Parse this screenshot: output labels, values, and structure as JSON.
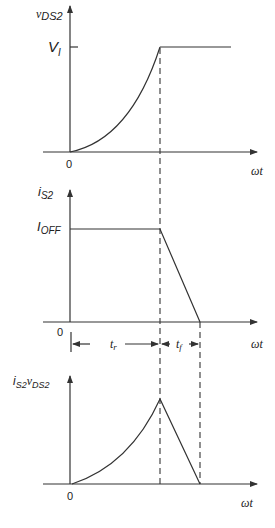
{
  "diagram": {
    "type": "switching-waveforms",
    "panels": [
      {
        "id": "vds",
        "y_label_main": "v",
        "y_label_sub": "DS2",
        "level_label_main": "V",
        "level_label_sub": "I",
        "origin_label": "0",
        "x_label": "ωt"
      },
      {
        "id": "is",
        "y_label_main": "i",
        "y_label_sub": "S2",
        "level_label_main": "I",
        "level_label_sub": "OFF",
        "origin_label": "0",
        "x_label": "ωt"
      },
      {
        "id": "power",
        "y_label_main1": "i",
        "y_label_sub1": "S2",
        "y_label_main2": "v",
        "y_label_sub2": "DS2",
        "origin_label": "0",
        "x_label": "ωt"
      }
    ],
    "intervals": [
      {
        "main": "t",
        "sub": "r"
      },
      {
        "main": "t",
        "sub": "f"
      }
    ]
  }
}
